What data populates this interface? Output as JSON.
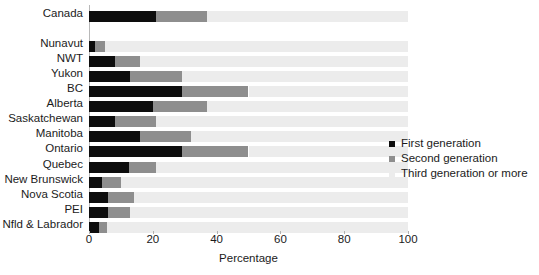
{
  "chart_data": {
    "type": "bar",
    "orientation": "horizontal",
    "stacked": true,
    "title": "",
    "xlabel": "Percentage",
    "ylabel": "",
    "xlim": [
      0,
      100
    ],
    "xticks": [
      0,
      20,
      40,
      60,
      80,
      100
    ],
    "grid": false,
    "legend_position": "right",
    "categories": [
      "Canada",
      "",
      "Nunavut",
      "NWT",
      "Yukon",
      "BC",
      "Alberta",
      "Saskatchewan",
      "Manitoba",
      "Ontario",
      "Quebec",
      "New Brunswick",
      "Nova Scotia",
      "PEI",
      "Nfld & Labrador"
    ],
    "series": [
      {
        "name": "First generation",
        "color": "#0d0d0d",
        "values": [
          21,
          null,
          2,
          8,
          13,
          29,
          20,
          8,
          16,
          29,
          12.5,
          4,
          6,
          6,
          3
        ]
      },
      {
        "name": "Second generation",
        "color": "#8e8e8e",
        "values": [
          16,
          null,
          3,
          8,
          16,
          21,
          17,
          13,
          16,
          21,
          8.5,
          6,
          8,
          7,
          2.5
        ]
      },
      {
        "name": "Third generation or more",
        "color": "#ececec",
        "values": [
          63,
          null,
          95,
          84,
          71,
          50,
          63,
          79,
          68,
          50,
          79,
          90,
          86,
          87,
          94.5
        ]
      }
    ]
  },
  "legend": {
    "items": [
      {
        "label": "First generation",
        "color": "#0d0d0d"
      },
      {
        "label": "Second generation",
        "color": "#8e8e8e"
      },
      {
        "label": "Third generation or more",
        "color": "#ececec"
      }
    ]
  },
  "axis": {
    "x_label": "Percentage",
    "x_ticks": [
      "0",
      "20",
      "40",
      "60",
      "80",
      "100"
    ]
  }
}
